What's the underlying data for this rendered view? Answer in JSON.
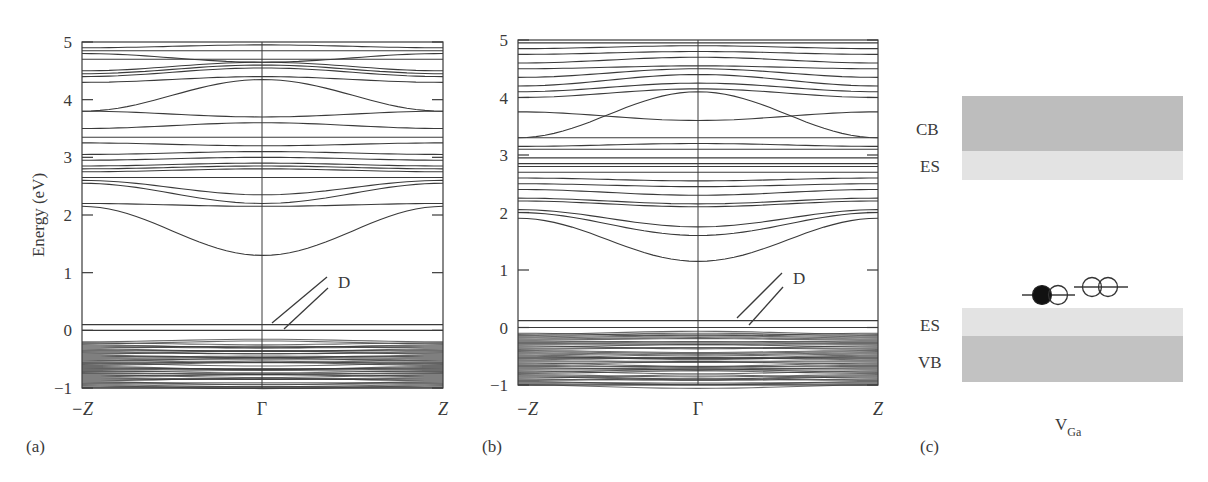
{
  "chart_data": [
    {
      "panel": "(a)",
      "type": "line",
      "subtype": "band-structure",
      "title": "",
      "xlabel": "",
      "ylabel": "Energy (eV)",
      "x_ticks": [
        "-Z",
        "Γ",
        "Z"
      ],
      "y_ticks": [
        -1,
        0,
        1,
        2,
        3,
        4,
        5
      ],
      "ylim": [
        -1,
        5
      ],
      "grid": false,
      "annotation": {
        "text": "D",
        "points_to": "two defect levels near 0 eV"
      },
      "defect_levels_eV": [
        0.1,
        0.0
      ],
      "valence_band_region_eV": [
        -1.0,
        -0.2
      ],
      "conduction_band_minimum_at_gamma_eV": 1.3,
      "bands": [
        {
          "id": "cb1",
          "edge": 2.15,
          "gamma": 1.3
        },
        {
          "id": "cb2",
          "edge": 2.2,
          "gamma": 2.15
        },
        {
          "id": "cb3",
          "edge": 2.55,
          "gamma": 2.2
        },
        {
          "id": "cb4",
          "edge": 2.6,
          "gamma": 2.35
        },
        {
          "id": "cb5",
          "edge": 2.65,
          "gamma": 2.65
        },
        {
          "id": "cb6",
          "edge": 2.75,
          "gamma": 2.8
        },
        {
          "id": "cb7",
          "edge": 2.8,
          "gamma": 2.85
        },
        {
          "id": "cb8",
          "edge": 2.85,
          "gamma": 2.9
        },
        {
          "id": "cb9",
          "edge": 2.95,
          "gamma": 3.0
        },
        {
          "id": "cb10",
          "edge": 3.05,
          "gamma": 3.1
        },
        {
          "id": "cb11",
          "edge": 3.25,
          "gamma": 3.2
        },
        {
          "id": "cb12",
          "edge": 3.35,
          "gamma": 3.35
        },
        {
          "id": "cb13",
          "edge": 3.5,
          "gamma": 3.6
        },
        {
          "id": "cb14",
          "edge": 3.8,
          "gamma": 3.7
        },
        {
          "id": "cb15",
          "edge": 3.8,
          "gamma": 4.35
        },
        {
          "id": "cb16",
          "edge": 4.3,
          "gamma": 4.4
        },
        {
          "id": "cb17",
          "edge": 4.4,
          "gamma": 4.55
        },
        {
          "id": "cb18",
          "edge": 4.45,
          "gamma": 4.6
        },
        {
          "id": "cb19",
          "edge": 4.5,
          "gamma": 4.65
        },
        {
          "id": "cb20",
          "edge": 4.7,
          "gamma": 4.7
        },
        {
          "id": "cb21",
          "edge": 4.8,
          "gamma": 4.65
        },
        {
          "id": "cb22",
          "edge": 4.85,
          "gamma": 4.85
        },
        {
          "id": "cb23",
          "edge": 4.9,
          "gamma": 4.95
        }
      ]
    },
    {
      "panel": "(b)",
      "type": "line",
      "subtype": "band-structure",
      "title": "",
      "xlabel": "",
      "ylabel": "",
      "x_ticks": [
        "-Z",
        "Γ",
        "Z"
      ],
      "y_ticks": [
        -1,
        0,
        1,
        2,
        3,
        4,
        5
      ],
      "ylim": [
        -1,
        5
      ],
      "grid": false,
      "annotation": {
        "text": "D",
        "points_to": "two defect levels near 0 eV"
      },
      "defect_levels_eV": [
        0.12,
        0.0
      ],
      "valence_band_region_eV": [
        -1.0,
        -0.1
      ],
      "conduction_band_minimum_at_gamma_eV": 1.15,
      "bands": [
        {
          "id": "cb1",
          "edge": 1.9,
          "gamma": 1.15
        },
        {
          "id": "cb2",
          "edge": 2.0,
          "gamma": 1.6
        },
        {
          "id": "cb3",
          "edge": 2.05,
          "gamma": 1.75
        },
        {
          "id": "cb4",
          "edge": 2.2,
          "gamma": 2.1
        },
        {
          "id": "cb5",
          "edge": 2.25,
          "gamma": 2.15
        },
        {
          "id": "cb6",
          "edge": 2.4,
          "gamma": 2.3
        },
        {
          "id": "cb7",
          "edge": 2.5,
          "gamma": 2.45
        },
        {
          "id": "cb8",
          "edge": 2.6,
          "gamma": 2.55
        },
        {
          "id": "cb9",
          "edge": 2.7,
          "gamma": 2.7
        },
        {
          "id": "cb10",
          "edge": 2.8,
          "gamma": 2.8
        },
        {
          "id": "cb11",
          "edge": 2.85,
          "gamma": 2.85
        },
        {
          "id": "cb12",
          "edge": 2.95,
          "gamma": 2.95
        },
        {
          "id": "cb13",
          "edge": 3.1,
          "gamma": 3.1
        },
        {
          "id": "cb14",
          "edge": 3.15,
          "gamma": 3.2
        },
        {
          "id": "cb15",
          "edge": 3.3,
          "gamma": 3.3
        },
        {
          "id": "cb16",
          "edge": 3.3,
          "gamma": 4.1
        },
        {
          "id": "cb17",
          "edge": 3.75,
          "gamma": 3.6
        },
        {
          "id": "cb18",
          "edge": 4.0,
          "gamma": 4.15
        },
        {
          "id": "cb19",
          "edge": 4.1,
          "gamma": 4.25
        },
        {
          "id": "cb20",
          "edge": 4.2,
          "gamma": 4.4
        },
        {
          "id": "cb21",
          "edge": 4.35,
          "gamma": 4.5
        },
        {
          "id": "cb22",
          "edge": 4.5,
          "gamma": 4.55
        },
        {
          "id": "cb23",
          "edge": 4.6,
          "gamma": 4.7
        },
        {
          "id": "cb24",
          "edge": 4.75,
          "gamma": 4.8
        },
        {
          "id": "cb25",
          "edge": 4.85,
          "gamma": 4.9
        },
        {
          "id": "cb26",
          "edge": 4.95,
          "gamma": 4.95
        }
      ]
    },
    {
      "panel": "(c)",
      "type": "diagram",
      "subtype": "energy-level-schematic",
      "title": "",
      "xlabel": "V_Ga",
      "labels": [
        "CB",
        "ES",
        "ES",
        "VB"
      ],
      "defect_levels": [
        {
          "occupancy": [
            "filled",
            "empty"
          ],
          "position": "lower"
        },
        {
          "occupancy": [
            "empty",
            "empty"
          ],
          "position": "higher"
        }
      ]
    }
  ],
  "labels": {
    "y_axis_title": "Energy (eV)",
    "y_ticks": [
      "5",
      "4",
      "3",
      "2",
      "1",
      "0",
      "−1"
    ],
    "k_minus_z": "−Z",
    "k_gamma": "Γ",
    "k_z": "Z",
    "defect_marker": "D",
    "panel_a": "(a)",
    "panel_b": "(b)",
    "panel_c": "(c)",
    "cb": "CB",
    "es_top": "ES",
    "es_bottom": "ES",
    "vb": "VB",
    "vacancy_main": "V",
    "vacancy_sub": "Ga"
  },
  "colors": {
    "line": "#3a3a3a",
    "cb_band": "#bdbdbd",
    "es_band": "#e3e3e3",
    "vb_band": "#c2c2c2",
    "filled_circle": "#111111"
  }
}
